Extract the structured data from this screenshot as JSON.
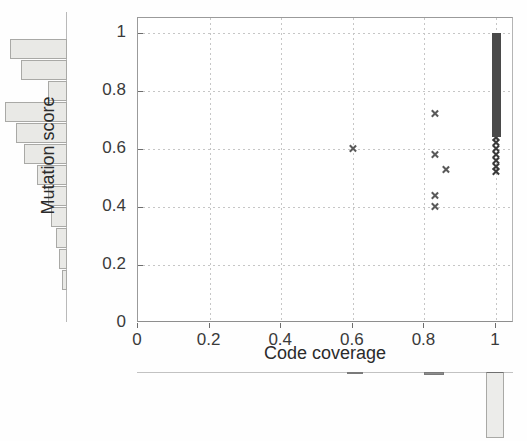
{
  "chart_data": {
    "type": "scatter",
    "title": "",
    "xlabel": "Code coverage",
    "ylabel": "Mutation score",
    "xlim": [
      0,
      1.05
    ],
    "ylim": [
      0,
      1.05
    ],
    "xticks": [
      "0",
      "0.2",
      "0.4",
      "0.6",
      "0.8",
      "1"
    ],
    "xtick_values": [
      0,
      0.2,
      0.4,
      0.6,
      0.8,
      1
    ],
    "yticks": [
      "0",
      "0.2",
      "0.4",
      "0.6",
      "0.8",
      "1"
    ],
    "ytick_values": [
      0,
      0.2,
      0.4,
      0.6,
      0.8,
      1
    ],
    "grid": true,
    "grid_style": "dotted",
    "legend": "none",
    "marker": "x",
    "marker_color": "#5a5a5a",
    "points": [
      {
        "x": 0.6,
        "y": 0.6
      },
      {
        "x": 0.83,
        "y": 0.72
      },
      {
        "x": 0.83,
        "y": 0.58
      },
      {
        "x": 0.86,
        "y": 0.53
      },
      {
        "x": 0.83,
        "y": 0.44
      },
      {
        "x": 0.83,
        "y": 0.4
      },
      {
        "x": 1.0,
        "y": 0.52
      },
      {
        "x": 1.0,
        "y": 0.54
      },
      {
        "x": 1.0,
        "y": 0.56
      },
      {
        "x": 1.0,
        "y": 0.58
      },
      {
        "x": 1.0,
        "y": 0.6
      },
      {
        "x": 1.0,
        "y": 0.62
      },
      {
        "x": 1.0,
        "y": 0.64
      }
    ],
    "dense_column": {
      "x": 1.0,
      "y_start": 0.64,
      "y_end": 1.0,
      "description": "saturated overlapping markers at full code coverage"
    },
    "marginal_x": {
      "type": "bar",
      "orientation": "vertical",
      "description": "code coverage distribution below main axes",
      "bins": [
        {
          "center": 0.61,
          "count": 2,
          "width": 0.045
        },
        {
          "center": 0.83,
          "count": 3,
          "width": 0.055
        },
        {
          "center": 1.0,
          "count": 62,
          "width": 0.05
        }
      ]
    },
    "marginal_y": {
      "type": "bar",
      "orientation": "horizontal",
      "description": "mutation score distribution left of main axes",
      "bins": [
        {
          "center": 0.96,
          "count": 0
        },
        {
          "center": 0.9,
          "count": 21
        },
        {
          "center": 0.84,
          "count": 17
        },
        {
          "center": 0.78,
          "count": 7
        },
        {
          "center": 0.72,
          "count": 23
        },
        {
          "center": 0.66,
          "count": 19
        },
        {
          "center": 0.6,
          "count": 16
        },
        {
          "center": 0.54,
          "count": 11
        },
        {
          "center": 0.48,
          "count": 7
        },
        {
          "center": 0.42,
          "count": 6
        },
        {
          "center": 0.36,
          "count": 4
        },
        {
          "center": 0.3,
          "count": 3
        },
        {
          "center": 0.18,
          "count": 2
        }
      ]
    }
  },
  "axes": {
    "x_title": "Code coverage",
    "y_title": "Mutation score",
    "x_ticklabels": [
      "0",
      "0.2",
      "0.4",
      "0.6",
      "0.8",
      "1"
    ],
    "y_ticklabels": [
      "0",
      "0.2",
      "0.4",
      "0.6",
      "0.8",
      "1"
    ]
  },
  "colors": {
    "marker": "#5a5a5a",
    "marker_dense": "#3a3a3a",
    "hist_fill": "#e9e9e6",
    "hist_edge": "#a9a9a6",
    "grid": "#c6c6c6",
    "axis": "#9a9a9a",
    "text": "#2b2b2b"
  }
}
